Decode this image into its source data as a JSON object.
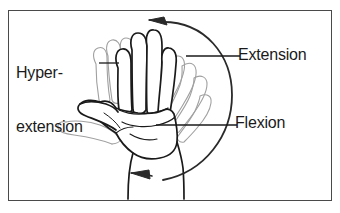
{
  "figure": {
    "kind": "anatomy-illustration",
    "frame_border_color": "#4a4a4a",
    "background_color": "#ffffff",
    "ink_color": "#1a1a1a",
    "ghost_color": "#9a9a9a"
  },
  "labels": {
    "hyperextension_line1": "Hyper-",
    "hyperextension_line2": "extension",
    "extension": "Extension",
    "flexion": "Flexion"
  },
  "arrows": {
    "top_direction": "left",
    "bottom_direction": "left",
    "arc_side": "right"
  }
}
